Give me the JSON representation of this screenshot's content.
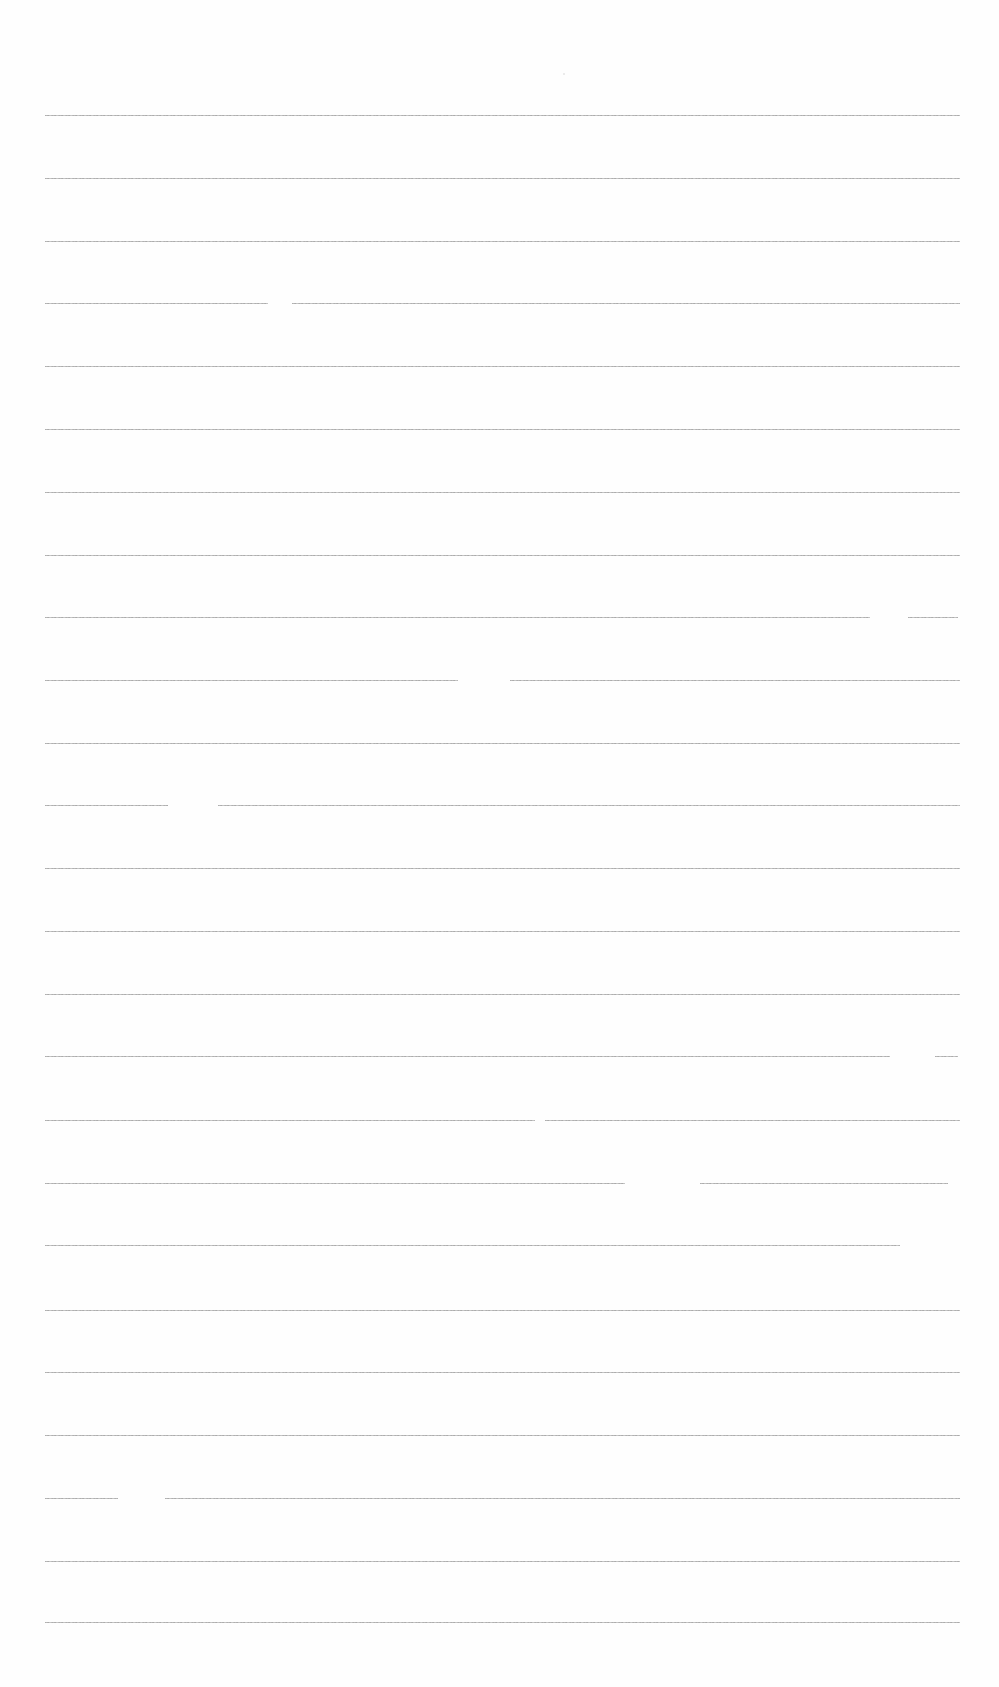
{
  "document": {
    "type": "blank lined paper",
    "background_color": "#fefefe",
    "line_color": "#a0a0a0",
    "line_count": 25,
    "line_spacing_px": 62.8,
    "margin_left_px": 45,
    "margin_right_px": 960
  },
  "lines": [
    {
      "y": 115,
      "segments": [
        [
          45,
          960
        ]
      ]
    },
    {
      "y": 178,
      "segments": [
        [
          45,
          960
        ]
      ]
    },
    {
      "y": 241,
      "segments": [
        [
          45,
          960
        ]
      ]
    },
    {
      "y": 303,
      "segments": [
        [
          45,
          268
        ],
        [
          292,
          960
        ]
      ]
    },
    {
      "y": 366,
      "segments": [
        [
          45,
          960
        ]
      ]
    },
    {
      "y": 429,
      "segments": [
        [
          45,
          960
        ]
      ]
    },
    {
      "y": 492,
      "segments": [
        [
          45,
          960
        ]
      ]
    },
    {
      "y": 555,
      "segments": [
        [
          45,
          960
        ]
      ]
    },
    {
      "y": 617,
      "segments": [
        [
          45,
          870
        ],
        [
          908,
          958
        ]
      ]
    },
    {
      "y": 680,
      "segments": [
        [
          45,
          458
        ],
        [
          510,
          960
        ]
      ]
    },
    {
      "y": 743,
      "segments": [
        [
          45,
          960
        ]
      ]
    },
    {
      "y": 805,
      "segments": [
        [
          45,
          168
        ],
        [
          218,
          960
        ]
      ]
    },
    {
      "y": 868,
      "segments": [
        [
          45,
          960
        ]
      ]
    },
    {
      "y": 931,
      "segments": [
        [
          45,
          960
        ]
      ]
    },
    {
      "y": 994,
      "segments": [
        [
          45,
          960
        ]
      ]
    },
    {
      "y": 1056,
      "segments": [
        [
          45,
          890
        ],
        [
          935,
          958
        ]
      ]
    },
    {
      "y": 1120,
      "segments": [
        [
          45,
          535
        ],
        [
          545,
          960
        ]
      ]
    },
    {
      "y": 1183,
      "segments": [
        [
          45,
          625
        ],
        [
          700,
          948
        ]
      ]
    },
    {
      "y": 1245,
      "segments": [
        [
          45,
          900
        ]
      ]
    },
    {
      "y": 1310,
      "segments": [
        [
          45,
          960
        ]
      ]
    },
    {
      "y": 1372,
      "segments": [
        [
          45,
          960
        ]
      ]
    },
    {
      "y": 1435,
      "segments": [
        [
          45,
          960
        ]
      ]
    },
    {
      "y": 1498,
      "segments": [
        [
          45,
          118
        ],
        [
          165,
          960
        ]
      ]
    },
    {
      "y": 1561,
      "segments": [
        [
          45,
          960
        ]
      ]
    },
    {
      "y": 1622,
      "segments": [
        [
          45,
          960
        ]
      ]
    }
  ]
}
